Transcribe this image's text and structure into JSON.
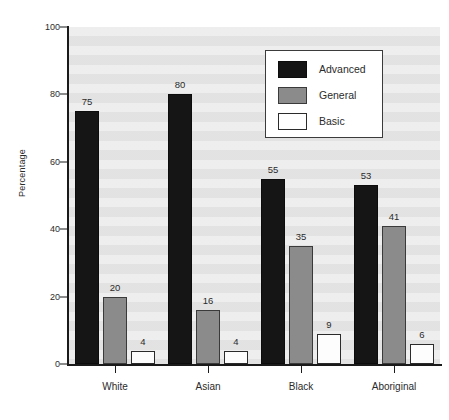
{
  "chart_data": {
    "type": "bar",
    "title": "",
    "subtitle": "",
    "xlabel": "",
    "ylabel": "Percentage",
    "ylim": [
      0,
      100
    ],
    "yticks": [
      0,
      20,
      40,
      60,
      80,
      100
    ],
    "grid": false,
    "legend_position": "top-right",
    "categories": [
      "White",
      "Asian",
      "Black",
      "Aboriginal"
    ],
    "series": [
      {
        "name": "Advanced",
        "color": "#151515",
        "values": [
          75,
          80,
          55,
          53
        ]
      },
      {
        "name": "General",
        "color": "#8b8b8b",
        "values": [
          20,
          16,
          35,
          41
        ]
      },
      {
        "name": "Basic",
        "color": "#ffffff",
        "values": [
          4,
          4,
          9,
          6
        ]
      }
    ]
  },
  "axes": {
    "y_title": "Percentage",
    "y_tick_labels": [
      "0",
      "20",
      "40",
      "60",
      "80",
      "100"
    ],
    "x_tick_labels": [
      "White",
      "Asian",
      "Black",
      "Aboriginal"
    ]
  },
  "legend": {
    "entries": [
      {
        "label": "Advanced",
        "swatch": "advanced"
      },
      {
        "label": "General",
        "swatch": "general"
      },
      {
        "label": "Basic",
        "swatch": "basic"
      }
    ]
  },
  "bar_labels": {
    "white": [
      "75",
      "20",
      "4"
    ],
    "asian": [
      "80",
      "16",
      "4"
    ],
    "black": [
      "55",
      "35",
      "9"
    ],
    "aboriginal": [
      "53",
      "41",
      "6"
    ]
  }
}
